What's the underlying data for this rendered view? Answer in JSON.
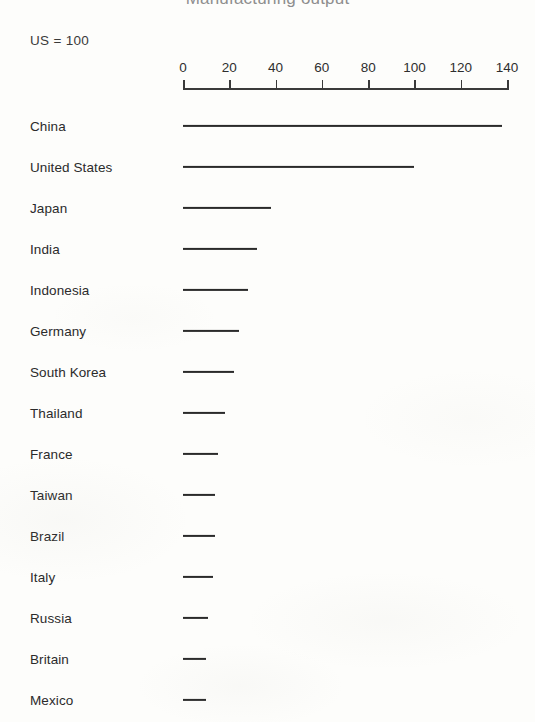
{
  "chart": {
    "title_cropped": "Manufacturing output",
    "subtitle": "US = 100",
    "tick_labels": [
      "0",
      "20",
      "40",
      "60",
      "80",
      "100",
      "120",
      "140"
    ]
  },
  "chart_data": {
    "type": "bar",
    "orientation": "horizontal",
    "title": "Manufacturing output",
    "subtitle": "US = 100",
    "xlabel": "",
    "ylabel": "",
    "xlim": [
      0,
      140
    ],
    "xticks": [
      0,
      20,
      40,
      60,
      80,
      100,
      120,
      140
    ],
    "grid": false,
    "legend": false,
    "bar_color": "#2a2a2a",
    "categories": [
      "China",
      "United States",
      "Japan",
      "India",
      "Indonesia",
      "Germany",
      "South Korea",
      "Thailand",
      "France",
      "Taiwan",
      "Brazil",
      "Italy",
      "Russia",
      "Britain",
      "Mexico"
    ],
    "values": [
      138,
      100,
      38,
      32,
      28,
      24,
      22,
      18,
      15,
      14,
      14,
      13,
      11,
      10,
      10
    ]
  }
}
